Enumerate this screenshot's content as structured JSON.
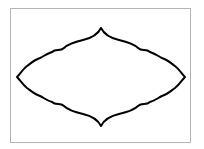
{
  "figure": {
    "stroke_color": "#000000",
    "border_color": "#b4b4b4",
    "background": "#ffffff"
  }
}
